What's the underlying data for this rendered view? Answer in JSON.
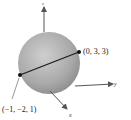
{
  "figure": {
    "type": "sphere-diameter-3d",
    "axes": {
      "z_label": "z",
      "y_label": "y",
      "x_label": "x"
    },
    "points": [
      {
        "name": "endpoint-a",
        "label": "(0, 3, 3)"
      },
      {
        "name": "endpoint-b",
        "label": "(−1, −2, 1)"
      }
    ],
    "colors": {
      "sphere_light": "#d4d4d4",
      "sphere_dark": "#8a8a8a",
      "axis": "#555555",
      "segment": "#1a1a1a",
      "point": "#111111"
    }
  }
}
